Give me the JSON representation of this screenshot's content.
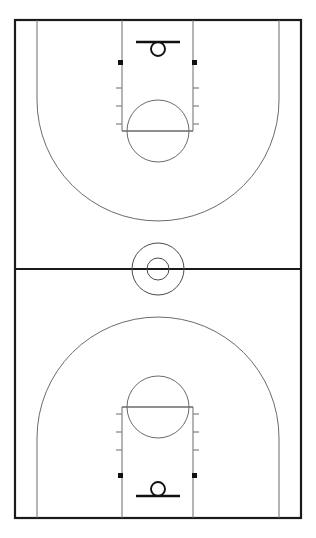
{
  "diagram": {
    "orientation": "vertical",
    "view": "full-court",
    "background_color": "#ffffff",
    "line_color": "#1a1a1a",
    "secondary_line_color": "#6b6b6b",
    "block_color": "#111111"
  },
  "canvas": {
    "width": 316,
    "height": 538
  },
  "court": {
    "label": "court-boundary",
    "x": 15,
    "y": 20,
    "width": 286,
    "height": 498,
    "stroke_width": 2.2
  },
  "halfcourt": {
    "label": "halfcourt-line",
    "x1": 15,
    "x2": 301,
    "y": 269,
    "stroke_width": 2
  },
  "center_circle": {
    "label": "center-circle",
    "cx": 158,
    "cy": 269,
    "outer_radius": 26,
    "inner_radius": 11
  },
  "halves": [
    {
      "name": "top-half",
      "basket_end": "top",
      "baseline_y": 20,
      "direction": 1,
      "lane": {
        "label": "free-throw-lane",
        "left_x": 122,
        "right_x": 193,
        "baseline_y": 20,
        "free_throw_y": 131
      },
      "free_throw_circle": {
        "label": "free-throw-circle",
        "cx": 158,
        "cy": 131,
        "radius": 31
      },
      "backboard": {
        "label": "backboard",
        "x1": 136,
        "x2": 180,
        "y": 42,
        "stroke_width": 2.6
      },
      "rim": {
        "label": "rim",
        "cx": 158,
        "cy": 49,
        "radius": 7
      },
      "three_point": {
        "label": "three-point-line",
        "left_x": 37,
        "right_x": 279,
        "straight_end_y": 100,
        "arc_apex_y": 182,
        "arc_radius": 121
      },
      "lane_blocks": [
        {
          "side": "left",
          "x": 118,
          "y": 60,
          "width": 5,
          "height": 5
        },
        {
          "side": "right",
          "x": 192,
          "y": 60,
          "width": 5,
          "height": 5
        }
      ],
      "lane_ticks": [
        {
          "side": "left",
          "y": 88
        },
        {
          "side": "left",
          "y": 106
        },
        {
          "side": "left",
          "y": 124
        },
        {
          "side": "right",
          "y": 88
        },
        {
          "side": "right",
          "y": 106
        },
        {
          "side": "right",
          "y": 124
        }
      ]
    },
    {
      "name": "bottom-half",
      "basket_end": "bottom",
      "baseline_y": 518,
      "direction": -1,
      "lane": {
        "label": "free-throw-lane",
        "left_x": 122,
        "right_x": 193,
        "baseline_y": 518,
        "free_throw_y": 407
      },
      "free_throw_circle": {
        "label": "free-throw-circle",
        "cx": 158,
        "cy": 407,
        "radius": 31
      },
      "backboard": {
        "label": "backboard",
        "x1": 136,
        "x2": 180,
        "y": 496,
        "stroke_width": 2.6
      },
      "rim": {
        "label": "rim",
        "cx": 158,
        "cy": 489,
        "radius": 7
      },
      "three_point": {
        "label": "three-point-line",
        "left_x": 37,
        "right_x": 279,
        "straight_end_y": 438,
        "arc_apex_y": 356,
        "arc_radius": 121
      },
      "lane_blocks": [
        {
          "side": "left",
          "x": 118,
          "y": 473,
          "width": 5,
          "height": 5
        },
        {
          "side": "right",
          "x": 192,
          "y": 473,
          "width": 5,
          "height": 5
        }
      ],
      "lane_ticks": [
        {
          "side": "left",
          "y": 450
        },
        {
          "side": "left",
          "y": 432
        },
        {
          "side": "left",
          "y": 414
        },
        {
          "side": "right",
          "y": 450
        },
        {
          "side": "right",
          "y": 432
        },
        {
          "side": "right",
          "y": 414
        }
      ]
    }
  ],
  "tick_length": 6
}
